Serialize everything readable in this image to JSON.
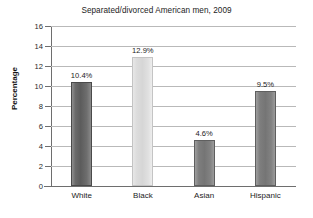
{
  "chart_data": {
    "type": "bar",
    "title": "Separated/divorced American men, 2009",
    "xlabel": "",
    "ylabel": "Percentage",
    "categories": [
      "White",
      "Black",
      "Asian",
      "Hispanic"
    ],
    "values": [
      10.4,
      12.9,
      4.6,
      9.5
    ],
    "data_labels": [
      "10.4%",
      "12.9%",
      "4.6%",
      "9.5%"
    ],
    "ylim": [
      0,
      16
    ],
    "ytick_labels": [
      "16",
      "14",
      "12",
      "10",
      "8",
      "6",
      "4",
      "2",
      "0"
    ],
    "ytick_values": [
      16,
      14,
      12,
      10,
      8,
      6,
      4,
      2,
      0
    ],
    "grid": true,
    "legend": "none",
    "bar_colors": [
      "#5c5c5c",
      "#d6d6d6",
      "#757575",
      "#757575"
    ],
    "gridline_color": "#b9b9b9",
    "axis_color": "#6e6e6e",
    "text_color": "#1c1c1c",
    "background_color": "#ffffff"
  }
}
